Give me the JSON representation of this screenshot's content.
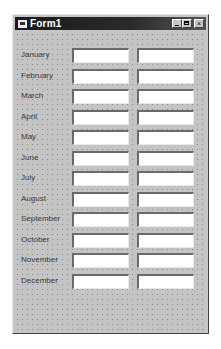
{
  "window": {
    "title": "Form1",
    "icon": "form-icon",
    "controls": {
      "minimize": "minimize-icon",
      "maximize": "maximize-icon",
      "close": "×"
    }
  },
  "form": {
    "rows": [
      {
        "label": "January",
        "value1": "",
        "value2": ""
      },
      {
        "label": "February",
        "value1": "",
        "value2": ""
      },
      {
        "label": "March",
        "value1": "",
        "value2": ""
      },
      {
        "label": "April",
        "value1": "",
        "value2": ""
      },
      {
        "label": "May",
        "value1": "",
        "value2": ""
      },
      {
        "label": "June",
        "value1": "",
        "value2": ""
      },
      {
        "label": "July",
        "value1": "",
        "value2": ""
      },
      {
        "label": "August",
        "value1": "",
        "value2": ""
      },
      {
        "label": "September",
        "value1": "",
        "value2": ""
      },
      {
        "label": "October",
        "value1": "",
        "value2": ""
      },
      {
        "label": "November",
        "value1": "",
        "value2": ""
      },
      {
        "label": "December",
        "value1": "",
        "value2": ""
      }
    ]
  }
}
